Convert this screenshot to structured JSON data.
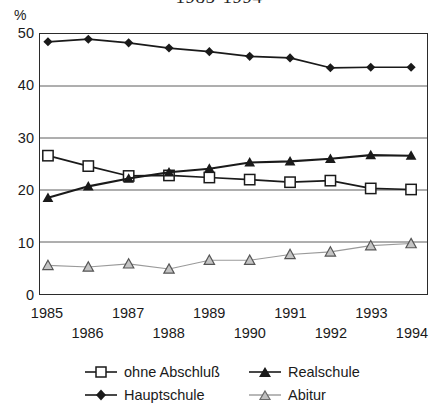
{
  "chart_data": {
    "type": "line",
    "title": "1985-1994",
    "xlabel": "",
    "ylabel": "%",
    "ylim": [
      0,
      50
    ],
    "yticks": [
      0,
      10,
      20,
      30,
      40,
      50
    ],
    "grid": true,
    "legend_position": "bottom",
    "categories": [
      1985,
      1986,
      1987,
      1988,
      1989,
      1990,
      1991,
      1992,
      1993,
      1994
    ],
    "series": [
      {
        "name": "ohne Abschluß",
        "marker": "open-square",
        "color": "#1a1a1a",
        "values": [
          26.6,
          24.6,
          22.7,
          22.8,
          22.4,
          22.0,
          21.5,
          21.8,
          20.3,
          20.1
        ]
      },
      {
        "name": "Hauptschule",
        "marker": "filled-diamond",
        "color": "#1a1a1a",
        "values": [
          48.5,
          49.0,
          48.3,
          47.3,
          46.6,
          45.7,
          45.4,
          43.5,
          43.6,
          43.6
        ]
      },
      {
        "name": "Realschule",
        "marker": "filled-triangle",
        "color": "#1a1a1a",
        "values": [
          18.5,
          20.7,
          22.2,
          23.4,
          24.1,
          25.3,
          25.5,
          26.0,
          26.7,
          26.6
        ]
      },
      {
        "name": "Abitur",
        "marker": "open-triangle",
        "color": "#8c8c8c",
        "values": [
          5.5,
          5.2,
          5.8,
          4.8,
          6.5,
          6.5,
          7.6,
          8.1,
          9.3,
          9.7
        ]
      }
    ]
  },
  "axes": {
    "y_unit": "%",
    "y_tick_labels": [
      "50",
      "40",
      "30",
      "20",
      "10",
      "0"
    ],
    "x_tick_labels_top": [
      "1985",
      "1987",
      "1989",
      "1991",
      "1993"
    ],
    "x_tick_labels_bottom": [
      "1986",
      "1988",
      "1990",
      "1992",
      "1994"
    ]
  },
  "legend": {
    "entries": [
      {
        "label": "ohne Abschluß"
      },
      {
        "label": "Hauptschule"
      },
      {
        "label": "Realschule"
      },
      {
        "label": "Abitur"
      }
    ]
  }
}
